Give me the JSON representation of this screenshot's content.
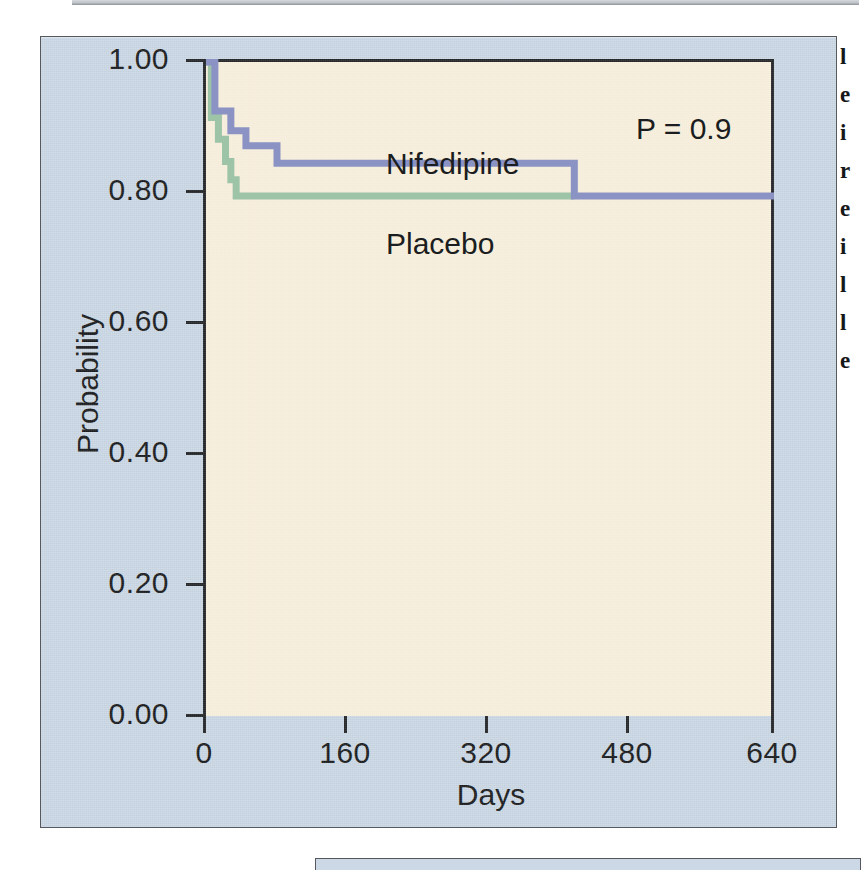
{
  "figure": {
    "panel_bg": "#ccd8e6",
    "plot_bg": "#fdf4e0",
    "axis_color": "#26282b"
  },
  "chart_data": {
    "type": "line",
    "subtype": "kaplan-meier-step",
    "title": "",
    "xlabel": "Days",
    "ylabel": "Probability",
    "xlim": [
      0,
      640
    ],
    "ylim": [
      0.0,
      1.0
    ],
    "xticks": [
      0,
      160,
      320,
      480,
      640
    ],
    "xtick_labels": [
      "0",
      "160",
      "320",
      "480",
      "640"
    ],
    "yticks": [
      0.0,
      0.2,
      0.4,
      0.6,
      0.8,
      1.0
    ],
    "ytick_labels": [
      "0.00",
      "0.20",
      "0.40",
      "0.60",
      "0.80",
      "1.00"
    ],
    "grid": false,
    "legend": "inline-annotations",
    "annotations": [
      {
        "text": "P = 0.9",
        "x": 540,
        "y": 0.955
      },
      {
        "text": "Nifedipine",
        "x": 250,
        "y": 0.9
      },
      {
        "text": "Placebo",
        "x": 250,
        "y": 0.745
      }
    ],
    "series": [
      {
        "name": "Nifedipine",
        "color": "#8b92c4",
        "steps": [
          {
            "x": 0,
            "y": 1.0
          },
          {
            "x": 10,
            "y": 1.0
          },
          {
            "x": 10,
            "y": 0.925
          },
          {
            "x": 28,
            "y": 0.925
          },
          {
            "x": 28,
            "y": 0.895
          },
          {
            "x": 45,
            "y": 0.895
          },
          {
            "x": 45,
            "y": 0.872
          },
          {
            "x": 80,
            "y": 0.872
          },
          {
            "x": 80,
            "y": 0.845
          },
          {
            "x": 415,
            "y": 0.845
          },
          {
            "x": 415,
            "y": 0.795
          },
          {
            "x": 640,
            "y": 0.795
          }
        ]
      },
      {
        "name": "Placebo",
        "color": "#9ec4a8",
        "steps": [
          {
            "x": 0,
            "y": 1.0
          },
          {
            "x": 6,
            "y": 1.0
          },
          {
            "x": 6,
            "y": 0.915
          },
          {
            "x": 14,
            "y": 0.915
          },
          {
            "x": 14,
            "y": 0.882
          },
          {
            "x": 22,
            "y": 0.882
          },
          {
            "x": 22,
            "y": 0.848
          },
          {
            "x": 28,
            "y": 0.848
          },
          {
            "x": 28,
            "y": 0.82
          },
          {
            "x": 34,
            "y": 0.82
          },
          {
            "x": 34,
            "y": 0.795
          },
          {
            "x": 415,
            "y": 0.795
          }
        ]
      }
    ]
  },
  "side_text": {
    "lines": [
      "l",
      "e",
      "i",
      "r",
      "e",
      "i",
      "l",
      "l",
      "e"
    ]
  }
}
